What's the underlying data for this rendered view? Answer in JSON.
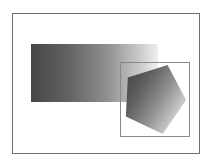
{
  "figure": {
    "background_color": "#ffffff",
    "width": 211,
    "height": 165
  },
  "outer_frame": {
    "name": "page-border",
    "border_color": "#6e6e6e",
    "border_width": 1,
    "x": 12,
    "y": 13,
    "width": 188,
    "height": 141,
    "fill": "#ffffff"
  },
  "shapes": [
    {
      "name": "gradient-rectangle",
      "type": "rectangle",
      "x": 31,
      "y": 44,
      "width": 127,
      "height": 58,
      "gradient": {
        "direction": "horizontal",
        "from_color": "#4a4a4a",
        "mid_color": "#868686",
        "to_color": "#ededed"
      }
    },
    {
      "name": "gradient-pentagon",
      "type": "pentagon",
      "gradient": {
        "direction": "diagonal",
        "from_color": "#4b4b4b",
        "mid_color": "#8d8d8d",
        "to_color": "#dedede"
      },
      "points": "7,15 48,2 67,38 43,73 5,55"
    }
  ],
  "inner_box": {
    "name": "clipping-frame",
    "border_color": "#8a8a8a",
    "border_width": 1,
    "x": 120,
    "y": 62,
    "width": 70,
    "height": 75
  },
  "caption": {
    "text": ""
  }
}
